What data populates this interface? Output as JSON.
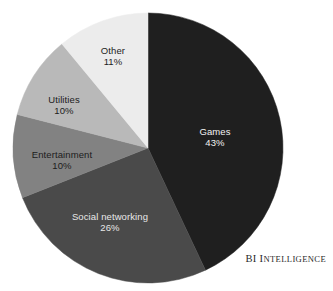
{
  "chart_data": {
    "type": "pie",
    "title": "",
    "subtitle": "",
    "xlabel": "",
    "ylabel": "",
    "legend_position": "none",
    "grid": false,
    "value_unit": "%",
    "start_angle_deg": 0,
    "direction": "clockwise",
    "categories": [
      "Games",
      "Social networking",
      "Entertainment",
      "Utilities",
      "Other"
    ],
    "values": [
      43,
      26,
      10,
      10,
      11
    ],
    "slices": [
      {
        "label": "Games",
        "value": 43,
        "value_text": "43%",
        "color": "#1f1f1f",
        "label_color": "#f2f2f2",
        "label_x": 215,
        "label_y": 137
      },
      {
        "label": "Social networking",
        "value": 26,
        "value_text": "26%",
        "color": "#4a4a4a",
        "label_color": "#e8e8e8",
        "label_x": 110,
        "label_y": 222
      },
      {
        "label": "Entertainment",
        "value": 10,
        "value_text": "10%",
        "color": "#828282",
        "label_color": "#1c1c1c",
        "label_x": 62,
        "label_y": 160
      },
      {
        "label": "Utilities",
        "value": 10,
        "value_text": "10%",
        "color": "#b9b9b9",
        "label_color": "#1c1c1c",
        "label_x": 64,
        "label_y": 105
      },
      {
        "label": "Other",
        "value": 11,
        "value_text": "11%",
        "color": "#ececec",
        "label_color": "#1c1c1c",
        "label_x": 113,
        "label_y": 56
      }
    ]
  },
  "attribution": {
    "prefix": "BI ",
    "first_letter": "I",
    "rest": "NTELLIGENCE"
  }
}
